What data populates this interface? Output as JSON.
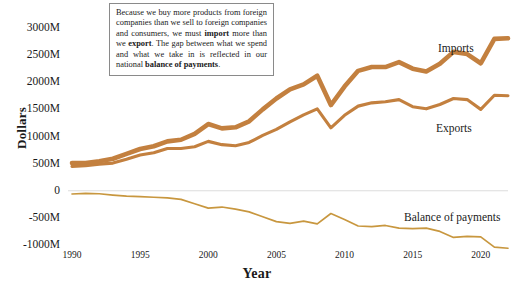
{
  "chart_data": {
    "type": "line",
    "title": "",
    "xlabel": "Year",
    "ylabel": "Dollars",
    "xlim": [
      1990,
      2022
    ],
    "ylim": [
      -1000,
      3000
    ],
    "xticks": [
      1990,
      1995,
      2000,
      2005,
      2010,
      2015,
      2020
    ],
    "xtick_labels": [
      "1990",
      "1995",
      "2000",
      "2005",
      "2010",
      "2015",
      "2020"
    ],
    "yticks": [
      3000,
      2500,
      2000,
      1500,
      1000,
      500,
      0,
      -500,
      -1000
    ],
    "ytick_labels": [
      "3000M",
      "2500M",
      "2000M",
      "1500M",
      "1000M",
      "500M",
      "0",
      "-500M",
      "-1000M"
    ],
    "grid": "zero-line-only",
    "legend_position": "inline-right",
    "x": [
      1990,
      1991,
      1992,
      1993,
      1994,
      1995,
      1996,
      1997,
      1998,
      1999,
      2000,
      2001,
      2002,
      2003,
      2004,
      2005,
      2006,
      2007,
      2008,
      2009,
      2010,
      2011,
      2012,
      2013,
      2014,
      2015,
      2016,
      2017,
      2018,
      2019,
      2020,
      2021,
      2022
    ],
    "series": [
      {
        "name": "Imports",
        "color": "#C3803F",
        "width": 4.6,
        "values": [
          510,
          510,
          545,
          590,
          680,
          770,
          820,
          910,
          940,
          1050,
          1230,
          1150,
          1170,
          1280,
          1500,
          1700,
          1870,
          1960,
          2120,
          1580,
          1920,
          2210,
          2280,
          2280,
          2370,
          2250,
          2200,
          2340,
          2560,
          2520,
          2350,
          2800,
          2810
        ]
      },
      {
        "name": "Exports",
        "color": "#C3803F",
        "width": 3.1,
        "values": [
          450,
          460,
          490,
          510,
          580,
          660,
          700,
          780,
          780,
          810,
          910,
          850,
          830,
          890,
          1020,
          1130,
          1270,
          1400,
          1510,
          1160,
          1390,
          1560,
          1620,
          1640,
          1680,
          1550,
          1510,
          1590,
          1700,
          1680,
          1500,
          1760,
          1750
        ]
      },
      {
        "name": "Balance of payments",
        "color": "#C8973F",
        "width": 1.7,
        "values": [
          -60,
          -50,
          -55,
          -80,
          -100,
          -110,
          -120,
          -130,
          -160,
          -240,
          -320,
          -300,
          -340,
          -390,
          -480,
          -570,
          -600,
          -560,
          -610,
          -420,
          -530,
          -650,
          -660,
          -640,
          -690,
          -700,
          -690,
          -750,
          -860,
          -840,
          -850,
          -1040,
          -1060
        ]
      }
    ],
    "annotation": {
      "segments": [
        {
          "text": "Because we buy more products from foreign companies than we sell to foreign companies and consumers, we must ",
          "bold": false
        },
        {
          "text": "import",
          "bold": true
        },
        {
          "text": " more than we ",
          "bold": false
        },
        {
          "text": "export",
          "bold": true
        },
        {
          "text": ". The gap between what we spend and what we take in is reflected in our national ",
          "bold": false
        },
        {
          "text": "balance of payments",
          "bold": true
        },
        {
          "text": ".",
          "bold": false
        }
      ]
    }
  }
}
